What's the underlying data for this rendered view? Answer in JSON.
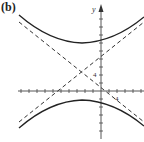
{
  "figure": {
    "panel_label": "(b)",
    "y_axis_label": "y",
    "y_tick_label": "4",
    "x_tick_label": "4"
  },
  "colors": {
    "curve": "#222222",
    "axis": "#444444",
    "asymptote": "#333333",
    "background": "#ffffff"
  },
  "graph": {
    "type": "hyperbola",
    "orientation": "vertical",
    "center_px": [
      82,
      72
    ],
    "axis_origin_px": [
      101,
      91
    ],
    "tick_spacing_px": 8,
    "asymptotes": "dashed",
    "branches": [
      "upper",
      "lower"
    ]
  }
}
